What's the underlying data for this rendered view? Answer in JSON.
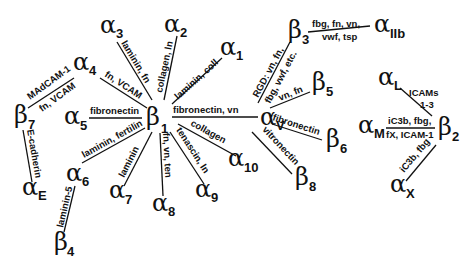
{
  "diagram": {
    "nodes": {
      "b1": {
        "sym": "β",
        "sub": "1"
      },
      "a1": {
        "sym": "α",
        "sub": "1"
      },
      "a2": {
        "sym": "α",
        "sub": "2"
      },
      "a3": {
        "sym": "α",
        "sub": "3"
      },
      "a4": {
        "sym": "α",
        "sub": "4"
      },
      "a5": {
        "sym": "α",
        "sub": "5"
      },
      "a6": {
        "sym": "α",
        "sub": "6"
      },
      "a7": {
        "sym": "α",
        "sub": "7"
      },
      "a8": {
        "sym": "α",
        "sub": "8"
      },
      "a9": {
        "sym": "α",
        "sub": "9"
      },
      "a10": {
        "sym": "α",
        "sub": "10"
      },
      "av": {
        "sym": "α",
        "sub": "V"
      },
      "b3": {
        "sym": "β",
        "sub": "3"
      },
      "aIIb": {
        "sym": "α",
        "sub": "IIb"
      },
      "b5": {
        "sym": "β",
        "sub": "5"
      },
      "b6": {
        "sym": "β",
        "sub": "6"
      },
      "b8": {
        "sym": "β",
        "sub": "8"
      },
      "b7": {
        "sym": "β",
        "sub": "7"
      },
      "aE": {
        "sym": "α",
        "sub": "E"
      },
      "b4": {
        "sym": "β",
        "sub": "4"
      },
      "aL": {
        "sym": "α",
        "sub": "L"
      },
      "aM": {
        "sym": "α",
        "sub": "M"
      },
      "b2": {
        "sym": "β",
        "sub": "2"
      },
      "aX": {
        "sym": "α",
        "sub": "X"
      }
    },
    "edges": {
      "b1_a1": "laminin, coll",
      "b1_a2": "collagen, ln",
      "b1_a3": "laminin, fn",
      "b1_a4": "fn, VCAM",
      "b1_a5": "fibronectin",
      "b1_a6": "laminin, fertilin",
      "b1_a7": "laminin",
      "b1_a8": "fn, vn, ten",
      "b1_a9": "tenascin, ln",
      "b1_a10": "collagen",
      "b1_av": "fibronectin, vn",
      "av_b3_top": "RGD: vn, fn,",
      "av_b3_bottom": "fbg, vwf, etc.",
      "b3_aIIb_top": "fbg, fn, vn,",
      "b3_aIIb_bottom": "vwf, tsp",
      "av_b5": "vn, fn",
      "av_b6": "fibronectin",
      "av_b8": "vitronectin",
      "a4_b7_top": "MAdCAM-1",
      "a4_b7_bottom": "fn, VCAM",
      "b7_aE": "E-cadherin",
      "a6_b4": "laminin-5",
      "aL_b2_top": "ICAMs",
      "aL_b2_bottom": "1-3",
      "aM_b2_top": "iC3b, fbg,",
      "aM_b2_bottom": "fX, ICAM-1",
      "aX_b2": "iC3b, fbg"
    }
  }
}
